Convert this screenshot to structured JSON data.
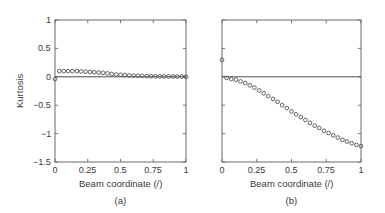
{
  "figure": {
    "background": "#ffffff",
    "axis_color": "#6b6b6b",
    "text_color": "#3a3a3a",
    "marker_color": "#5a5a5a",
    "zero_line_color": "#4a4a4a"
  },
  "ylabel": "Kurtosis",
  "panels": [
    {
      "key": "a",
      "caption": "(a)",
      "xlabel": "Beam coordinate (/)",
      "xticks": [
        "0",
        "0.25",
        "0.5",
        "0.75",
        "1"
      ],
      "yticks": [
        "1",
        "0.5",
        "0",
        "-0.5",
        "-1",
        "-1.5"
      ],
      "show_ylabels": true
    },
    {
      "key": "b",
      "caption": "(b)",
      "xlabel": "Beam coordinate (/)",
      "xticks": [
        "0",
        "0.25",
        "0.5",
        "0.75",
        "1"
      ],
      "yticks": [
        "1",
        "0.5",
        "0",
        "-0.5",
        "-1",
        "-1.5"
      ],
      "show_ylabels": false
    }
  ],
  "chart_data": [
    {
      "type": "scatter",
      "panel": "a",
      "title": "(a)",
      "xlabel": "Beam coordinate (/)",
      "ylabel": "Kurtosis",
      "xlim": [
        0,
        1
      ],
      "ylim": [
        -1.5,
        1
      ],
      "xticks": [
        0,
        0.25,
        0.5,
        0.75,
        1
      ],
      "yticks": [
        1,
        0.5,
        0,
        -0.5,
        -1,
        -1.5
      ],
      "grid": false,
      "legend": "none",
      "annotations": [
        "horizontal reference line at Kurtosis = 0"
      ],
      "reference_lines": [
        {
          "axis": "y",
          "value": 0
        }
      ],
      "series": [
        {
          "name": "Kurtosis vs beam coordinate",
          "marker": "open-circle",
          "x": [
            0.0,
            0.033,
            0.067,
            0.1,
            0.133,
            0.167,
            0.2,
            0.233,
            0.267,
            0.3,
            0.333,
            0.367,
            0.4,
            0.433,
            0.467,
            0.5,
            0.533,
            0.567,
            0.6,
            0.633,
            0.667,
            0.7,
            0.733,
            0.767,
            0.8,
            0.833,
            0.867,
            0.9,
            0.933,
            0.967,
            1.0
          ],
          "y": [
            -0.04,
            0.1,
            0.1,
            0.1,
            0.1,
            0.1,
            0.095,
            0.09,
            0.085,
            0.08,
            0.075,
            0.07,
            0.06,
            0.05,
            0.04,
            0.035,
            0.03,
            0.025,
            0.02,
            0.018,
            0.015,
            0.013,
            0.011,
            0.009,
            0.008,
            0.007,
            0.006,
            0.005,
            0.004,
            0.003,
            0.0
          ]
        }
      ]
    },
    {
      "type": "scatter",
      "panel": "b",
      "title": "(b)",
      "xlabel": "Beam coordinate (/)",
      "ylabel": "Kurtosis",
      "xlim": [
        0,
        1
      ],
      "ylim": [
        -1.5,
        1
      ],
      "xticks": [
        0,
        0.25,
        0.5,
        0.75,
        1
      ],
      "yticks": [
        1,
        0.5,
        0,
        -0.5,
        -1,
        -1.5
      ],
      "grid": false,
      "legend": "none",
      "annotations": [
        "horizontal reference line at Kurtosis = 0",
        "isolated marker at x = 0, Kurtosis = 0.30"
      ],
      "reference_lines": [
        {
          "axis": "y",
          "value": 0
        }
      ],
      "series": [
        {
          "name": "Kurtosis vs beam coordinate",
          "marker": "open-circle",
          "x": [
            0.0,
            0.033,
            0.067,
            0.1,
            0.133,
            0.167,
            0.2,
            0.233,
            0.267,
            0.3,
            0.333,
            0.367,
            0.4,
            0.433,
            0.467,
            0.5,
            0.533,
            0.567,
            0.6,
            0.633,
            0.667,
            0.7,
            0.733,
            0.767,
            0.8,
            0.833,
            0.867,
            0.9,
            0.933,
            0.967,
            1.0
          ],
          "y": [
            0.3,
            -0.02,
            -0.04,
            -0.05,
            -0.08,
            -0.11,
            -0.15,
            -0.19,
            -0.24,
            -0.29,
            -0.34,
            -0.39,
            -0.44,
            -0.5,
            -0.55,
            -0.61,
            -0.66,
            -0.71,
            -0.76,
            -0.81,
            -0.86,
            -0.9,
            -0.95,
            -0.99,
            -1.03,
            -1.07,
            -1.11,
            -1.14,
            -1.17,
            -1.2,
            -1.22
          ]
        }
      ]
    }
  ]
}
